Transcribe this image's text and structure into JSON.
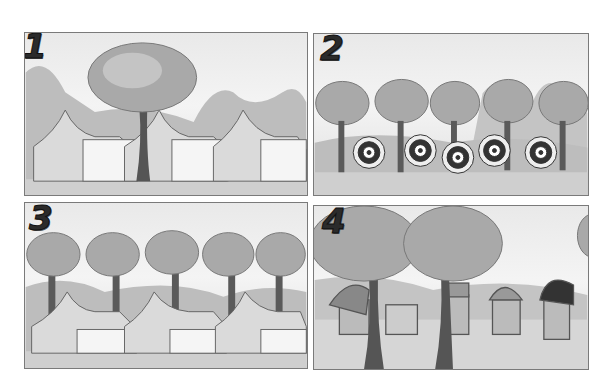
{
  "page": {
    "panels": [
      {
        "number": "1",
        "scene": "three tents behind one large tree"
      },
      {
        "number": "2",
        "scene": "five archery targets with arrows in front of trees"
      },
      {
        "number": "3",
        "scene": "three tents with a row of five trees behind"
      },
      {
        "number": "4",
        "scene": "five carts/wagons between two large trees"
      }
    ]
  },
  "colors": {
    "border": "#7a7a7a",
    "sky": "#f0f0f0",
    "ground": "#cfcfcf",
    "foliage": "#a9a9a9",
    "trunk": "#555555",
    "number": "#2b2b2b"
  }
}
